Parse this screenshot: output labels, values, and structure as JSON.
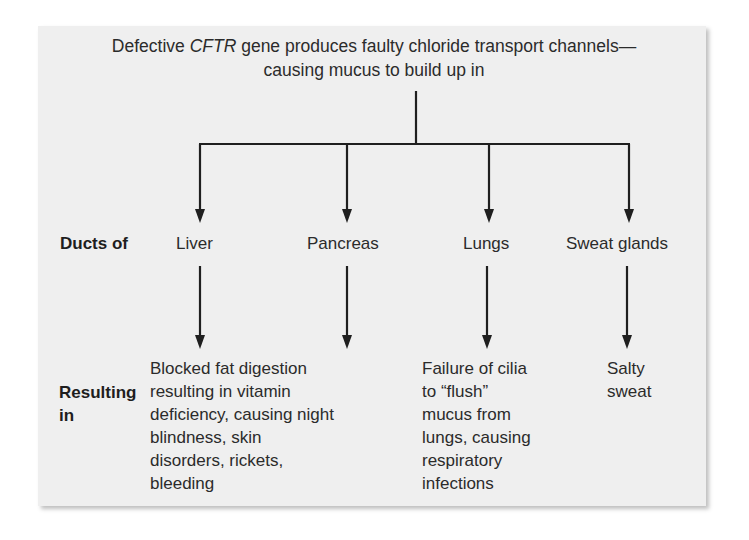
{
  "heading": {
    "line1_pre": "Defective ",
    "line1_gene": "CFTR",
    "line1_post": " gene produces faulty chloride transport channels—",
    "line2": "causing mucus to build up in"
  },
  "rows": {
    "ducts_label": "Ducts of",
    "resulting_label_1": "Resulting",
    "resulting_label_2": "in"
  },
  "organs": [
    {
      "name": "Liver",
      "result_lines": [
        "Blocked fat digestion",
        "resulting in vitamin",
        "deficiency, causing night",
        "blindness, skin",
        "disorders, rickets,",
        "bleeding"
      ]
    },
    {
      "name": "Pancreas",
      "result_lines": []
    },
    {
      "name": "Lungs",
      "result_lines": [
        "Failure of cilia",
        "to “flush”",
        "mucus from",
        "lungs, causing",
        "respiratory",
        "infections"
      ]
    },
    {
      "name": "Sweat glands",
      "result_lines": [
        "Salty",
        "sweat"
      ]
    }
  ],
  "colors": {
    "panel_bg": "#efefef",
    "line": "#1f1f1f",
    "text": "#2b2b2b"
  }
}
